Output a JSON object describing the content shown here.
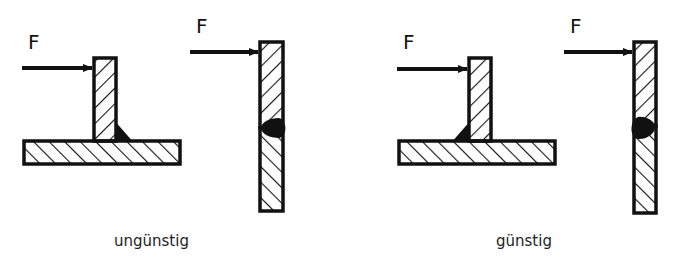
{
  "diagram": {
    "force_label": "F",
    "colors": {
      "stroke": "#111111",
      "background": "#ffffff"
    },
    "figures": [
      {
        "id": "t-joint-bad",
        "type": "T-joint",
        "weld_side": "right (away from force)",
        "group": "ungünstig"
      },
      {
        "id": "butt-joint-bad",
        "type": "butt joint",
        "weld_side": "right (away from force)",
        "group": "ungünstig"
      },
      {
        "id": "t-joint-good",
        "type": "T-joint",
        "weld_side": "left (force side)",
        "group": "günstig"
      },
      {
        "id": "butt-joint-good",
        "type": "butt joint",
        "weld_side": "left (force side)",
        "group": "günstig"
      }
    ],
    "labels": {
      "unfavorable": "ungünstig",
      "favorable": "günstig"
    }
  }
}
